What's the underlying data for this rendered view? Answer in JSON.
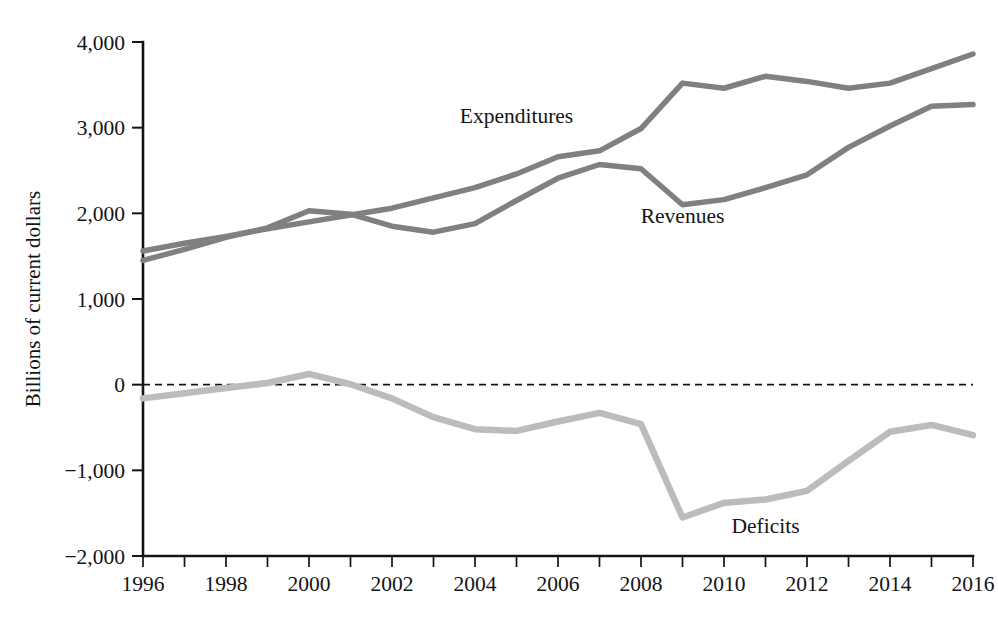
{
  "chart_data": {
    "type": "line",
    "title": "",
    "xlabel": "",
    "ylabel": "Billions of current dollars",
    "xlim": [
      1996,
      2016
    ],
    "ylim": [
      -2000,
      4000
    ],
    "grid": false,
    "legend": "inline-labels",
    "x": [
      1996,
      1997,
      1998,
      1999,
      2000,
      2001,
      2002,
      2003,
      2004,
      2005,
      2006,
      2007,
      2008,
      2009,
      2010,
      2011,
      2012,
      2013,
      2014,
      2015,
      2016
    ],
    "x_tick_labels": [
      "1996",
      "",
      "1998",
      "",
      "2000",
      "",
      "2002",
      "",
      "2004",
      "",
      "2006",
      "",
      "2008",
      "",
      "2010",
      "",
      "2012",
      "",
      "2014",
      "",
      "2016"
    ],
    "y_ticks": [
      -2000,
      -1000,
      0,
      1000,
      2000,
      3000,
      4000
    ],
    "y_tick_labels": [
      "−2,000",
      "−1,000",
      "0",
      "1,000",
      "2,000",
      "3,000",
      "4,000"
    ],
    "zero_reference_line": 0,
    "series": [
      {
        "name": "Expenditures",
        "color": "#808080",
        "label_x": 2005,
        "label_y": 3060,
        "values": [
          1560,
          1650,
          1730,
          1820,
          1900,
          1980,
          2060,
          2180,
          2300,
          2460,
          2660,
          2730,
          2990,
          3520,
          3460,
          3600,
          3540,
          3460,
          3520,
          3690,
          3860
        ]
      },
      {
        "name": "Revenues",
        "color": "#808080",
        "label_x": 2009,
        "label_y": 1890,
        "values": [
          1450,
          1580,
          1720,
          1830,
          2030,
          1990,
          1850,
          1780,
          1880,
          2150,
          2410,
          2570,
          2520,
          2100,
          2160,
          2300,
          2450,
          2770,
          3020,
          3250,
          3270
        ]
      },
      {
        "name": "Deficits",
        "color": "#bcbcbc",
        "label_x": 2011,
        "label_y": -1730,
        "values": [
          -160,
          -100,
          -40,
          20,
          125,
          5,
          -160,
          -380,
          -520,
          -540,
          -430,
          -330,
          -460,
          -1550,
          -1380,
          -1340,
          -1240,
          -890,
          -550,
          -470,
          -590
        ]
      }
    ]
  }
}
